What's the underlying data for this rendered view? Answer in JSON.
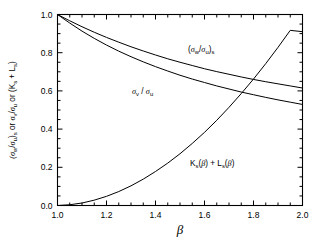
{
  "chart_data": {
    "type": "line",
    "title": "",
    "xlabel": "β",
    "ylabel": "(σw/σu)s or σv/σu or (Ks + Ls)",
    "xlim": [
      1.0,
      2.0
    ],
    "ylim": [
      0.0,
      1.0
    ],
    "grid": false,
    "legend_position": "inline-annotations",
    "xticks": [
      "1.0",
      "1.2",
      "1.4",
      "1.6",
      "1.8",
      "2.0"
    ],
    "xtick_values": [
      1.0,
      1.2,
      1.4,
      1.6,
      1.8,
      2.0
    ],
    "yticks": [
      "0.0",
      "0.2",
      "0.4",
      "0.6",
      "0.8",
      "1.0"
    ],
    "ytick_values": [
      0.0,
      0.2,
      0.4,
      0.6,
      0.8,
      1.0
    ],
    "x": [
      1.0,
      1.05,
      1.1,
      1.15,
      1.2,
      1.25,
      1.3,
      1.35,
      1.4,
      1.45,
      1.5,
      1.55,
      1.6,
      1.65,
      1.7,
      1.75,
      1.8,
      1.85,
      1.9,
      1.95,
      2.0
    ],
    "series": [
      {
        "name": "(σw/σu)s",
        "label_text": "(σw/σu)s",
        "values": [
          1.0,
          0.967,
          0.936,
          0.907,
          0.88,
          0.855,
          0.831,
          0.809,
          0.788,
          0.768,
          0.75,
          0.733,
          0.716,
          0.701,
          0.687,
          0.673,
          0.66,
          0.648,
          0.637,
          0.626,
          0.615
        ]
      },
      {
        "name": "σv/σu",
        "label_text": "σv/σu",
        "values": [
          1.0,
          0.955,
          0.913,
          0.875,
          0.84,
          0.808,
          0.779,
          0.752,
          0.727,
          0.704,
          0.682,
          0.662,
          0.644,
          0.626,
          0.61,
          0.594,
          0.58,
          0.566,
          0.553,
          0.541,
          0.529
        ]
      },
      {
        "name": "Ks(β) + Ls(β)",
        "label_text": "Ks(β) + Ls(β)",
        "values": [
          0.0,
          0.004,
          0.013,
          0.028,
          0.048,
          0.073,
          0.103,
          0.138,
          0.178,
          0.222,
          0.271,
          0.325,
          0.383,
          0.446,
          0.514,
          0.586,
          0.662,
          0.743,
          0.828,
          0.917,
          0.91
        ]
      }
    ],
    "annotations": [
      {
        "name": "upper-curve-label",
        "text": "(σw/σu)s",
        "x": 1.55,
        "y": 0.8
      },
      {
        "name": "middle-curve-label",
        "text": "σv/σu",
        "x": 1.38,
        "y": 0.615
      },
      {
        "name": "lower-curve-label",
        "text": "Ks(β) + Ls(β)",
        "x": 1.62,
        "y": 0.26
      }
    ]
  },
  "axes": {
    "xlabel": "β",
    "ylabel_parts": {
      "p1": "(",
      "sigma_w": "σ",
      "sub_w": "w",
      "slash1": "/",
      "sigma_u1": "σ",
      "sub_u1": "u",
      "p2": ")",
      "sub_s1": "s",
      "or1": "or",
      "sigma_v": "σ",
      "sub_v": "v",
      "slash2": "/",
      "sigma_u2": "σ",
      "sub_u2": "u",
      "or2": "or",
      "p3": "(",
      "k": "K",
      "sub_s2": "s",
      "plus": "+",
      "l": "L",
      "sub_s3": "s",
      "p4": ")"
    }
  },
  "labels": {
    "upper": {
      "open": "(",
      "sig1": "σ",
      "sub1": "w",
      "slash": "/",
      "sig2": "σ",
      "sub2": "u",
      "close": ")",
      "subs": "s"
    },
    "middle": {
      "sig1": "σ",
      "sub1": "v",
      "slash": "/",
      "sig2": "σ",
      "sub2": "u"
    },
    "lower": {
      "k": "K",
      "ksub": "s",
      "kopen": "(",
      "kbeta": "β",
      "kclose": ")",
      "plus": "+",
      "l": "L",
      "lsub": "s",
      "lopen": "(",
      "lbeta": "β",
      "lclose": ")"
    }
  },
  "ticks": {
    "x": [
      "1.0",
      "1.2",
      "1.4",
      "1.6",
      "1.8",
      "2.0"
    ],
    "y": [
      "0.0",
      "0.2",
      "0.4",
      "0.6",
      "0.8",
      "1.0"
    ]
  },
  "colors": {
    "background": "#ffffff",
    "axis": "#000000",
    "curve": "#000000"
  }
}
